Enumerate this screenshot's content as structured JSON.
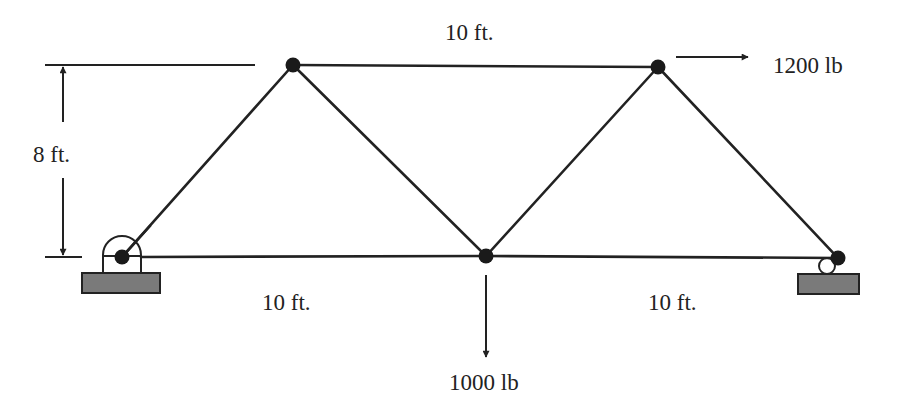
{
  "diagram": {
    "type": "planar truss",
    "nodes": [
      {
        "id": "A",
        "x": 122,
        "y": 257,
        "support": "pin"
      },
      {
        "id": "B",
        "x": 293,
        "y": 65
      },
      {
        "id": "C",
        "x": 486,
        "y": 256
      },
      {
        "id": "D",
        "x": 658,
        "y": 67
      },
      {
        "id": "E",
        "x": 838,
        "y": 258,
        "support": "roller"
      }
    ],
    "members": [
      [
        "A",
        "B"
      ],
      [
        "A",
        "C"
      ],
      [
        "B",
        "C"
      ],
      [
        "B",
        "D"
      ],
      [
        "C",
        "D"
      ],
      [
        "C",
        "E"
      ],
      [
        "D",
        "E"
      ]
    ],
    "labels": {
      "top_span": "10 ft.",
      "height": "8 ft.",
      "bottom_left_span": "10 ft.",
      "bottom_right_span": "10 ft.",
      "horizontal_load": "1200 lb",
      "vertical_load": "1000 lb"
    },
    "loads": [
      {
        "node": "D",
        "direction": "right",
        "magnitude": "1200 lb"
      },
      {
        "node": "C",
        "direction": "down",
        "magnitude": "1000 lb"
      }
    ]
  }
}
